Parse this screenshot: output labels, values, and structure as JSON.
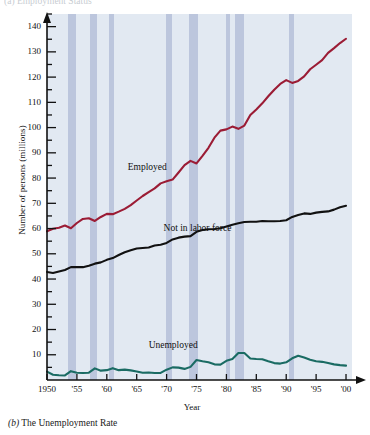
{
  "figure": {
    "top_caption": "(a) Employment Status",
    "bottom_caption_prefix": "(b)",
    "bottom_caption_text": "The Unemployment Rate"
  },
  "colors": {
    "plot_background": "#e2e9f2",
    "recession_band": "#b3bed8",
    "employed": "#9B1C35",
    "not_in_labor_force": "#111111",
    "unemployed": "#1A6B63",
    "axis": "#111111",
    "page_background": "#ffffff"
  },
  "chart_data": {
    "type": "line",
    "title": "",
    "subtitle": "",
    "xlabel": "Year",
    "ylabel": "Number of persons (millions)",
    "xlim": [
      1950,
      2001
    ],
    "ylim": [
      0,
      145
    ],
    "yticks": [
      10,
      20,
      30,
      40,
      50,
      60,
      70,
      80,
      90,
      100,
      110,
      120,
      130,
      140
    ],
    "ytick_labels": [
      "10",
      "20",
      "30",
      "40",
      "50",
      "60",
      "70",
      "80",
      "90",
      "100",
      "110",
      "120",
      "130",
      "140"
    ],
    "y_minor_tick_step": 5,
    "xticks": [
      1950,
      1955,
      1960,
      1965,
      1970,
      1975,
      1980,
      1985,
      1990,
      1995,
      2000
    ],
    "xtick_labels": [
      "1950",
      "'55",
      "'60",
      "'65",
      "'70",
      "'75",
      "'80",
      "'85",
      "'90",
      "'95",
      "'00"
    ],
    "grid": false,
    "legend": "inline-labels",
    "legend_position": "in-plot",
    "annotations": [
      {
        "text": "Employed",
        "x": 1963.5,
        "y": 84
      },
      {
        "text": "Not in labor force",
        "x": 1969.5,
        "y": 60
      },
      {
        "text": "Unemployed",
        "x": 1967.0,
        "y": 13.5
      }
    ],
    "shaded_regions_label": "Recessions",
    "shaded_regions": [
      {
        "start": 1953.5,
        "end": 1954.8
      },
      {
        "start": 1957.2,
        "end": 1958.4
      },
      {
        "start": 1960.3,
        "end": 1961.2
      },
      {
        "start": 1969.9,
        "end": 1970.9
      },
      {
        "start": 1973.8,
        "end": 1975.2
      },
      {
        "start": 1980.0,
        "end": 1980.6
      },
      {
        "start": 1981.5,
        "end": 1982.9
      },
      {
        "start": 1990.5,
        "end": 1991.3
      }
    ],
    "x": [
      1950,
      1951,
      1952,
      1953,
      1954,
      1955,
      1956,
      1957,
      1958,
      1959,
      1960,
      1961,
      1962,
      1963,
      1964,
      1965,
      1966,
      1967,
      1968,
      1969,
      1970,
      1971,
      1972,
      1973,
      1974,
      1975,
      1976,
      1977,
      1978,
      1979,
      1980,
      1981,
      1982,
      1983,
      1984,
      1985,
      1986,
      1987,
      1988,
      1989,
      1990,
      1991,
      1992,
      1993,
      1994,
      1995,
      1996,
      1997,
      1998,
      1999,
      2000
    ],
    "series": [
      {
        "name": "Employed",
        "color": "#9B1C35",
        "values": [
          58.9,
          59.9,
          60.3,
          61.2,
          60.1,
          62.2,
          63.8,
          64.1,
          63.0,
          64.6,
          65.8,
          65.7,
          66.7,
          67.8,
          69.3,
          71.1,
          72.9,
          74.4,
          75.9,
          77.9,
          78.7,
          79.4,
          82.2,
          85.1,
          86.8,
          85.8,
          88.8,
          92.0,
          96.0,
          98.8,
          99.3,
          100.4,
          99.5,
          100.8,
          105.0,
          107.2,
          109.6,
          112.4,
          115.0,
          117.3,
          118.8,
          117.7,
          118.5,
          120.3,
          123.1,
          124.9,
          126.7,
          129.6,
          131.5,
          133.5,
          135.2
        ]
      },
      {
        "name": "Not in labor force",
        "color": "#111111",
        "values": [
          42.8,
          42.4,
          43.0,
          43.6,
          44.7,
          44.7,
          44.7,
          45.3,
          46.1,
          46.6,
          47.6,
          48.3,
          49.5,
          50.6,
          51.4,
          52.1,
          52.3,
          52.5,
          53.3,
          53.6,
          54.3,
          55.7,
          56.4,
          56.8,
          57.0,
          58.7,
          59.4,
          59.7,
          59.8,
          60.1,
          60.8,
          61.5,
          62.1,
          62.6,
          62.7,
          62.7,
          63.0,
          62.9,
          62.9,
          63.0,
          63.3,
          64.6,
          65.4,
          66.0,
          65.8,
          66.3,
          66.6,
          66.8,
          67.5,
          68.4,
          69.0
        ]
      },
      {
        "name": "Unemployed",
        "color": "#1A6B63",
        "values": [
          3.3,
          2.1,
          1.9,
          1.8,
          3.5,
          2.9,
          2.8,
          2.9,
          4.6,
          3.7,
          3.9,
          4.7,
          3.9,
          4.1,
          3.8,
          3.4,
          2.9,
          3.0,
          2.8,
          2.8,
          4.1,
          5.0,
          4.9,
          4.4,
          5.2,
          7.9,
          7.4,
          7.0,
          6.2,
          6.1,
          7.6,
          8.3,
          10.7,
          10.7,
          8.5,
          8.3,
          8.2,
          7.4,
          6.7,
          6.5,
          7.0,
          8.6,
          9.6,
          8.9,
          8.0,
          7.4,
          7.2,
          6.7,
          6.2,
          5.9,
          5.7
        ]
      }
    ]
  }
}
